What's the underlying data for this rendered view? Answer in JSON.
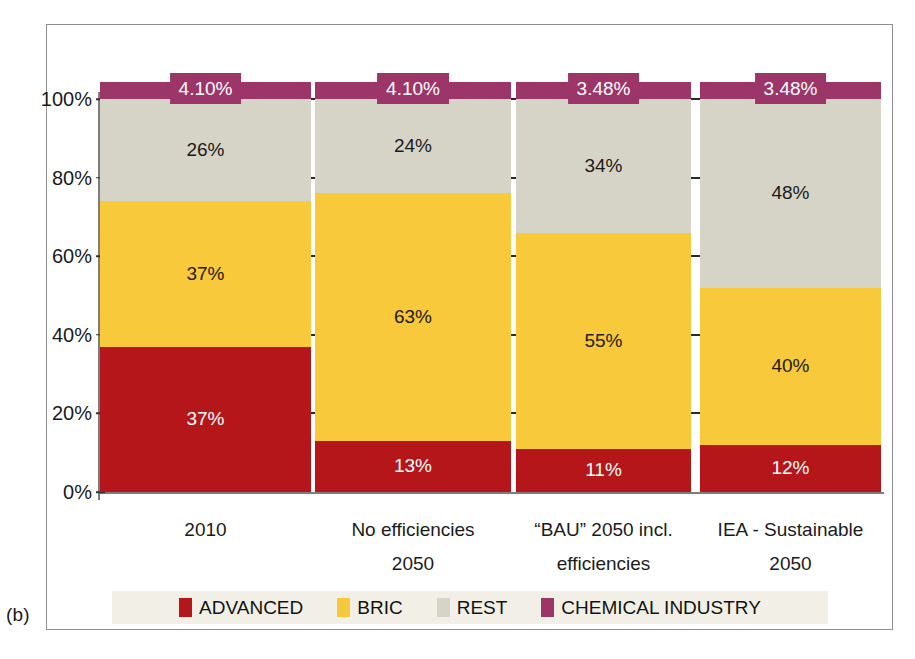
{
  "panel": {
    "label": "(b)"
  },
  "chart_data": {
    "type": "bar",
    "subtype": "stacked-percentage",
    "title": "",
    "xlabel": "",
    "ylabel": "",
    "ylim": [
      0,
      100
    ],
    "grid": true,
    "grid_style": "dashed",
    "legend_position": "bottom",
    "yticks": [
      "0%",
      "20%",
      "40%",
      "60%",
      "80%",
      "100%"
    ],
    "ytick_values": [
      0,
      20,
      40,
      60,
      80,
      100
    ],
    "categories": [
      "2010",
      "No efficiencies 2050",
      "“BAU” 2050 incl. efficiencies",
      "IEA - Sustainable 2050"
    ],
    "category_lines": [
      [
        "2010",
        ""
      ],
      [
        "No efficiencies",
        "2050"
      ],
      [
        "“BAU” 2050 incl.",
        "efficiencies"
      ],
      [
        "IEA - Sustainable",
        "2050"
      ]
    ],
    "series": [
      {
        "name": "ADVANCED",
        "color": "#b5161a",
        "values": [
          37,
          13,
          11,
          12
        ],
        "labels": [
          "37%",
          "13%",
          "11%",
          "12%"
        ]
      },
      {
        "name": "BRIC",
        "color": "#f8c93a",
        "values": [
          37,
          63,
          55,
          40
        ],
        "labels": [
          "37%",
          "63%",
          "55%",
          "40%"
        ]
      },
      {
        "name": "REST",
        "color": "#d6d4c7",
        "values": [
          26,
          24,
          34,
          48
        ],
        "labels": [
          "26%",
          "24%",
          "34%",
          "48%"
        ]
      },
      {
        "name": "CHEMICAL INDUSTRY",
        "color": "#9c3668",
        "values": [
          4.1,
          4.1,
          3.48,
          3.48
        ],
        "labels": [
          "4.10%",
          "4.10%",
          "3.48%",
          "3.48%"
        ]
      }
    ]
  },
  "legend": {
    "items": [
      {
        "label": "ADVANCED",
        "color": "#b5161a"
      },
      {
        "label": "BRIC",
        "color": "#f8c93a"
      },
      {
        "label": "REST",
        "color": "#d6d4c7"
      },
      {
        "label": "CHEMICAL INDUSTRY",
        "color": "#9c3668"
      }
    ]
  }
}
